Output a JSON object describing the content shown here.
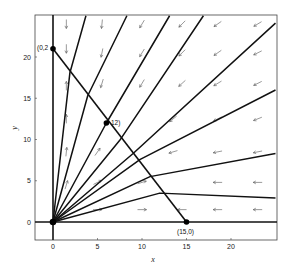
{
  "chart_data": {
    "type": "line",
    "subtype": "phase-plane vector field with trajectories",
    "title": "",
    "xlabel": "x",
    "ylabel": "y",
    "xlim": [
      -1.5,
      25
    ],
    "ylim": [
      -2.2,
      25
    ],
    "x_ticks": [
      0,
      5,
      10,
      15,
      20
    ],
    "y_ticks": [
      0,
      5,
      10,
      15,
      20
    ],
    "grid": false,
    "legend": null,
    "equilibrium_points": [
      {
        "x": 0,
        "y": 0,
        "label": ""
      },
      {
        "x": 0,
        "y": 21,
        "label": "(0,2"
      },
      {
        "x": 6,
        "y": 12,
        "label": "12)"
      },
      {
        "x": 15,
        "y": 0,
        "label": "(15,0)"
      }
    ],
    "nullcline_segment": {
      "from": [
        0,
        21
      ],
      "to": [
        15,
        0
      ]
    },
    "axes_lines": [
      {
        "name": "x=0 trajectory",
        "from": [
          0,
          0
        ],
        "to": [
          0,
          25
        ]
      },
      {
        "name": "y=0 trajectory",
        "from": [
          0,
          0
        ],
        "to": [
          25,
          0
        ]
      }
    ],
    "trajectories": [
      {
        "points": [
          [
            0,
            0
          ],
          [
            1.9,
            18.1
          ],
          [
            3.7,
            25
          ]
        ]
      },
      {
        "points": [
          [
            0,
            0
          ],
          [
            3.9,
            15.3
          ],
          [
            8.3,
            25
          ]
        ]
      },
      {
        "points": [
          [
            0,
            0
          ],
          [
            6,
            12
          ],
          [
            13.1,
            25
          ]
        ]
      },
      {
        "points": [
          [
            0,
            0
          ],
          [
            7.5,
            9.9
          ],
          [
            16.9,
            25
          ]
        ]
      },
      {
        "points": [
          [
            0,
            0
          ],
          [
            9,
            8.3
          ],
          [
            25,
            24.1
          ]
        ]
      },
      {
        "points": [
          [
            0,
            0
          ],
          [
            9.8,
            7.6
          ],
          [
            25,
            16
          ]
        ]
      },
      {
        "points": [
          [
            0,
            0
          ],
          [
            10.9,
            5.5
          ],
          [
            25,
            8.3
          ]
        ]
      },
      {
        "points": [
          [
            0,
            0
          ],
          [
            12,
            3.5
          ],
          [
            25,
            2.9
          ]
        ]
      }
    ],
    "vector_field_arrows": [
      {
        "x": 1.5,
        "y": 24,
        "dx": 0,
        "dy": -1
      },
      {
        "x": 1.5,
        "y": 21,
        "dx": 0,
        "dy": -1
      },
      {
        "x": 1.5,
        "y": 16.5,
        "dx": 0,
        "dy": 1
      },
      {
        "x": 1.5,
        "y": 12.5,
        "dx": 0,
        "dy": 1
      },
      {
        "x": 1.5,
        "y": 8.5,
        "dx": 0.1,
        "dy": 1
      },
      {
        "x": 1.5,
        "y": 4.5,
        "dx": 0.3,
        "dy": 1
      },
      {
        "x": 5.5,
        "y": 24,
        "dx": -0.1,
        "dy": -1
      },
      {
        "x": 5.5,
        "y": 20.5,
        "dx": -0.2,
        "dy": -1
      },
      {
        "x": 5.5,
        "y": 16.8,
        "dx": -0.3,
        "dy": -1
      },
      {
        "x": 5,
        "y": 8.5,
        "dx": 0.7,
        "dy": 1
      },
      {
        "x": 5,
        "y": 4.8,
        "dx": 1,
        "dy": 0.5
      },
      {
        "x": 5,
        "y": 1.5,
        "dx": 1,
        "dy": 0
      },
      {
        "x": 10,
        "y": 24,
        "dx": -0.6,
        "dy": -1
      },
      {
        "x": 10,
        "y": 20.5,
        "dx": -0.6,
        "dy": -1
      },
      {
        "x": 10,
        "y": 16.8,
        "dx": -0.6,
        "dy": -1
      },
      {
        "x": 10,
        "y": 4.8,
        "dx": 1,
        "dy": 0.3
      },
      {
        "x": 10,
        "y": 1.5,
        "dx": 1,
        "dy": 0
      },
      {
        "x": 14.5,
        "y": 24,
        "dx": -1,
        "dy": -1
      },
      {
        "x": 14.5,
        "y": 20.5,
        "dx": -1,
        "dy": -1
      },
      {
        "x": 14.5,
        "y": 16.8,
        "dx": -1,
        "dy": -0.9
      },
      {
        "x": 13.5,
        "y": 12.5,
        "dx": -1,
        "dy": -0.8
      },
      {
        "x": 13.5,
        "y": 8.5,
        "dx": -1,
        "dy": -0.3
      },
      {
        "x": 14.5,
        "y": 1.5,
        "dx": -1,
        "dy": 0
      },
      {
        "x": 18.5,
        "y": 24,
        "dx": -1,
        "dy": -0.7
      },
      {
        "x": 18.5,
        "y": 20.5,
        "dx": -1,
        "dy": -0.7
      },
      {
        "x": 18.5,
        "y": 16.8,
        "dx": -1,
        "dy": -0.6
      },
      {
        "x": 18.5,
        "y": 12.5,
        "dx": -1,
        "dy": -0.5
      },
      {
        "x": 18.5,
        "y": 8.5,
        "dx": -1,
        "dy": -0.2
      },
      {
        "x": 18.5,
        "y": 4.8,
        "dx": -1,
        "dy": 0
      },
      {
        "x": 18.5,
        "y": 1.5,
        "dx": -1,
        "dy": 0
      },
      {
        "x": 23,
        "y": 24,
        "dx": -1,
        "dy": -0.6
      },
      {
        "x": 23,
        "y": 20.5,
        "dx": -1,
        "dy": -0.5
      },
      {
        "x": 23,
        "y": 16.8,
        "dx": -1,
        "dy": -0.5
      },
      {
        "x": 23,
        "y": 12.5,
        "dx": -1,
        "dy": -0.4
      },
      {
        "x": 23,
        "y": 8.5,
        "dx": -1,
        "dy": -0.2
      },
      {
        "x": 23,
        "y": 4.8,
        "dx": -1,
        "dy": 0
      },
      {
        "x": 23,
        "y": 1.5,
        "dx": -1,
        "dy": 0
      }
    ]
  },
  "labels": {
    "xlabel": "x",
    "ylabel": "y",
    "x_ticks": [
      "0",
      "5",
      "10",
      "15",
      "20"
    ],
    "y_ticks": [
      "0",
      "5",
      "10",
      "15",
      "20"
    ],
    "pt_top": "(0,2",
    "pt_mid": "12)",
    "pt_right": "(15,0)"
  }
}
